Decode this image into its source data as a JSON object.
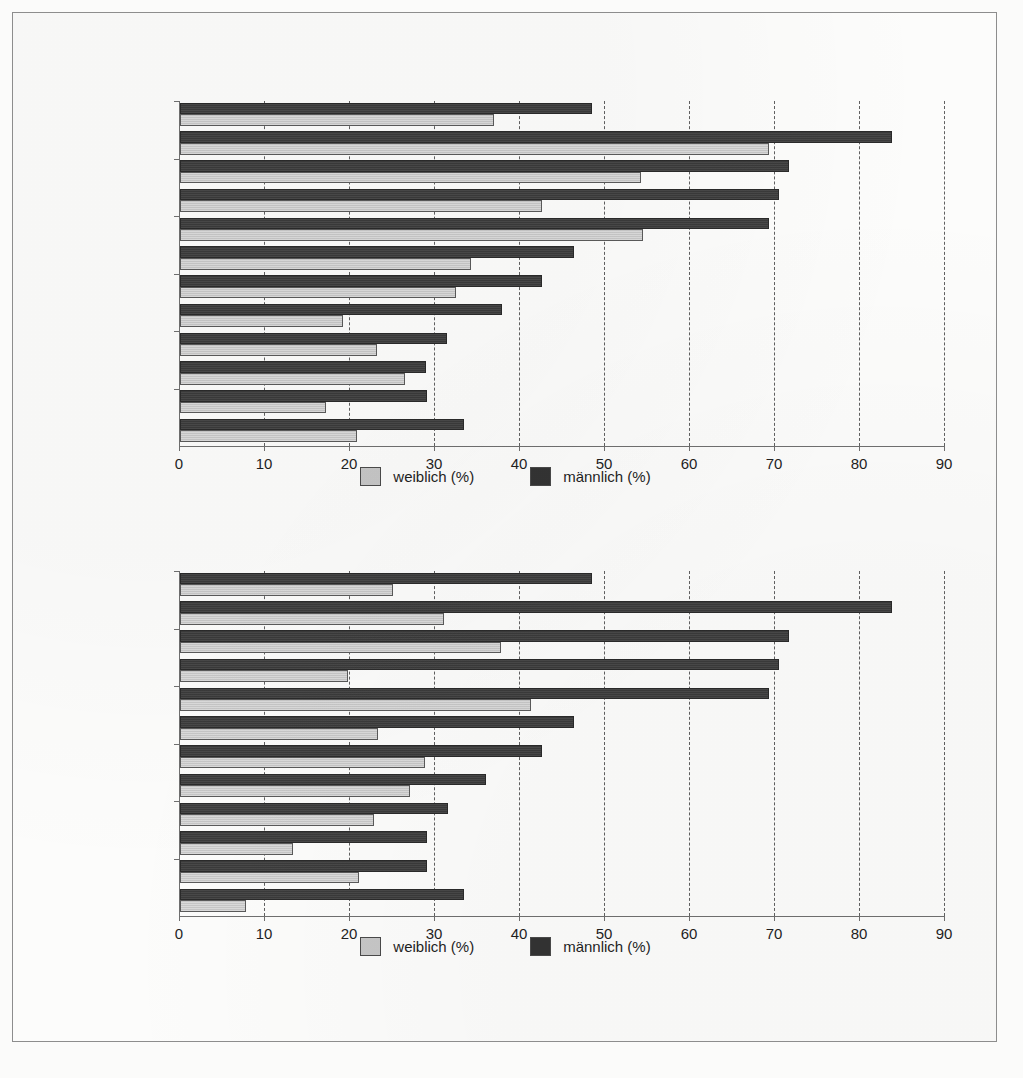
{
  "legend": {
    "female_label": "weiblich (%)",
    "male_label": "männlich (%)",
    "female_color": "#c6c6c6",
    "male_color": "#333333"
  },
  "axis": {
    "ticks": [
      "0",
      "10",
      "20",
      "30",
      "40",
      "50",
      "60",
      "70",
      "80",
      "90"
    ]
  },
  "chart_data": [
    {
      "type": "bar",
      "orientation": "horizontal",
      "title": "",
      "xlabel": "",
      "ylabel": "",
      "xlim": [
        0,
        90
      ],
      "xticks": [
        0,
        10,
        20,
        30,
        40,
        50,
        60,
        70,
        80,
        90
      ],
      "grid": true,
      "legend_position": "bottom-center",
      "categories": [
        "Matero",
        "Kalingalinga",
        "Mtendere",
        "Kanyama",
        "Chawama",
        "George"
      ],
      "category_label_positions": [
        1,
        3,
        5,
        7,
        9,
        11
      ],
      "series": [
        {
          "name": "weiblich (%)",
          "color": "#c6c6c6",
          "values": [
            36.9,
            69.3,
            54.2,
            42.6,
            54.5,
            34.2,
            32.5,
            19.2,
            23.2,
            26.5,
            17.2,
            20.8
          ]
        },
        {
          "name": "männlich (%)",
          "color": "#333333",
          "values": [
            48.5,
            83.8,
            71.6,
            70.5,
            69.3,
            46.3,
            42.6,
            37.9,
            31.4,
            28.9,
            29.0,
            33.4
          ]
        }
      ]
    },
    {
      "type": "bar",
      "orientation": "horizontal",
      "title": "",
      "xlabel": "",
      "ylabel": "",
      "xlim": [
        0,
        90
      ],
      "xticks": [
        0,
        10,
        20,
        30,
        40,
        50,
        60,
        70,
        80,
        90
      ],
      "grid": true,
      "legend_position": "bottom-center",
      "categories": [
        "Matero",
        "Kalingalinga",
        "Jack",
        "Chawama",
        "Mandevu",
        "Kanyama"
      ],
      "category_label_positions": [
        1,
        3,
        5,
        7,
        9,
        11
      ],
      "series": [
        {
          "name": "weiblich (%)",
          "color": "#c6c6c6",
          "values": [
            25.0,
            31.0,
            37.8,
            19.8,
            41.3,
            23.3,
            28.8,
            27.0,
            22.8,
            13.3,
            21.0,
            7.8
          ]
        },
        {
          "name": "männlich (%)",
          "color": "#333333",
          "values": [
            48.5,
            83.8,
            71.6,
            70.5,
            69.3,
            46.3,
            42.6,
            36.0,
            31.5,
            29.0,
            29.0,
            33.4
          ]
        }
      ]
    }
  ]
}
